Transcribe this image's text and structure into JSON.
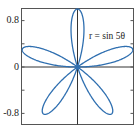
{
  "chart_data": {
    "type": "line",
    "subtype": "polar-rose",
    "title": "",
    "annotation": "r = sin 5θ",
    "equation": "r = sin(5*theta)",
    "petals": 5,
    "theta_range": [
      0,
      3.14159265
    ],
    "samples": 720,
    "xlabel": "",
    "ylabel": "",
    "xlim": [
      -0.97,
      0.97
    ],
    "ylim": [
      -1.0,
      1.0
    ],
    "y_ticks": [
      0.8,
      0,
      -0.8
    ],
    "y_tick_labels": [
      "0.8",
      "0",
      "-0.8"
    ],
    "y_minor_ticks": [
      0.4,
      -0.4
    ],
    "x_ticks": [],
    "grid": false,
    "legend": null,
    "axes_through_origin": true,
    "series": [
      {
        "name": "r = sin 5θ",
        "color": "#2f6fb0"
      }
    ]
  },
  "colors": {
    "curve": "#2f6fb0",
    "frame": "#555555",
    "axes": "#333333",
    "text": "#222222",
    "background": "#ffffff"
  },
  "labels": {
    "y_top": "0.8",
    "y_mid": "0",
    "y_bottom": "-0.8",
    "equation": "r = sin 5θ"
  }
}
